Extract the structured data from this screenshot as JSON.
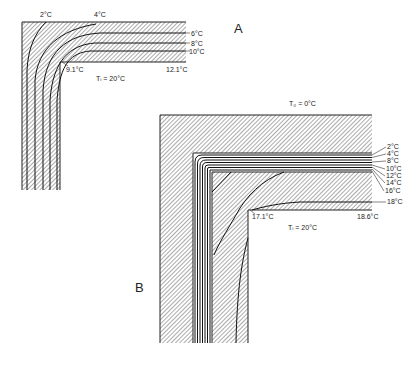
{
  "figure": {
    "panel_a": {
      "label": "A",
      "isotherm_labels": [
        "2°C",
        "4°C",
        "6°C",
        "8°C",
        "10°C"
      ],
      "surface_temps": {
        "corner": "9.1°C",
        "wall": "12.1°C"
      },
      "inside_temp": "Tᵢ = 20°C"
    },
    "panel_b": {
      "label": "B",
      "outside_temp": "T₀ = 0°C",
      "isotherm_labels": [
        "2°C",
        "4°C",
        "8°C",
        "10°C",
        "12°C",
        "14°C",
        "16°C",
        "18°C"
      ],
      "surface_temps": {
        "corner": "17.1°C",
        "wall": "18.6°C"
      },
      "inside_temp": "Tᵢ = 20°C"
    },
    "colors": {
      "ink": "#222222",
      "background": "#ffffff"
    }
  }
}
